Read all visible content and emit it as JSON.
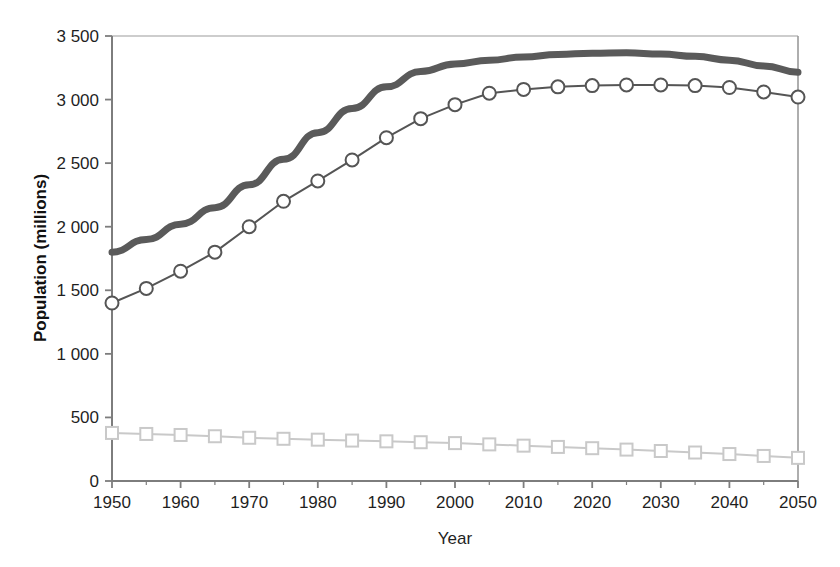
{
  "chart_data": {
    "type": "line",
    "title": "",
    "xlabel": "Year",
    "ylabel": "Population (millions)",
    "xlim": [
      1950,
      2050
    ],
    "ylim": [
      0,
      3500
    ],
    "grid": false,
    "legend_position": "none",
    "x_tick_labels": [
      "1950",
      "1960",
      "1970",
      "1980",
      "1990",
      "2000",
      "2010",
      "2020",
      "2030",
      "2040",
      "2050"
    ],
    "x_ticks": [
      1950,
      1960,
      1970,
      1980,
      1990,
      2000,
      2010,
      2020,
      2030,
      2040,
      2050
    ],
    "x_minor_ticks": [
      1955,
      1965,
      1975,
      1985,
      1995,
      2005,
      2015,
      2025,
      2035,
      2045
    ],
    "y_tick_labels": [
      "0",
      "500",
      "1 000",
      "1 500",
      "2 000",
      "2 500",
      "3 000",
      "3 500"
    ],
    "y_ticks": [
      0,
      500,
      1000,
      1500,
      2000,
      2500,
      3000,
      3500
    ],
    "x": [
      1950,
      1955,
      1960,
      1965,
      1970,
      1975,
      1980,
      1985,
      1990,
      1995,
      2000,
      2005,
      2010,
      2015,
      2020,
      2025,
      2030,
      2035,
      2040,
      2045,
      2050
    ],
    "series": [
      {
        "name": "upper-thick-line",
        "marker": "none",
        "color": "#5a5a5a",
        "line_width": 7,
        "values": [
          1800,
          1900,
          2020,
          2150,
          2330,
          2530,
          2740,
          2930,
          3100,
          3220,
          3280,
          3310,
          3335,
          3355,
          3365,
          3368,
          3358,
          3340,
          3310,
          3265,
          3215
        ]
      },
      {
        "name": "middle-circle-line",
        "marker": "circle",
        "color": "#555555",
        "line_width": 2,
        "values": [
          1400,
          1515,
          1650,
          1800,
          2000,
          2200,
          2360,
          2525,
          2700,
          2850,
          2960,
          3050,
          3080,
          3100,
          3110,
          3115,
          3115,
          3110,
          3095,
          3060,
          3020
        ]
      },
      {
        "name": "lower-square-line",
        "marker": "square",
        "color": "#c9c9c9",
        "line_width": 2,
        "values": [
          378,
          370,
          362,
          352,
          340,
          332,
          325,
          318,
          312,
          305,
          298,
          288,
          278,
          268,
          258,
          247,
          236,
          224,
          212,
          197,
          182
        ]
      }
    ]
  },
  "colors": {
    "axis": "#7d7d7d",
    "text": "#1f1f1f",
    "background": "#ffffff",
    "series_upper": "#5a5a5a",
    "series_middle": "#555555",
    "series_lower": "#c9c9c9"
  }
}
